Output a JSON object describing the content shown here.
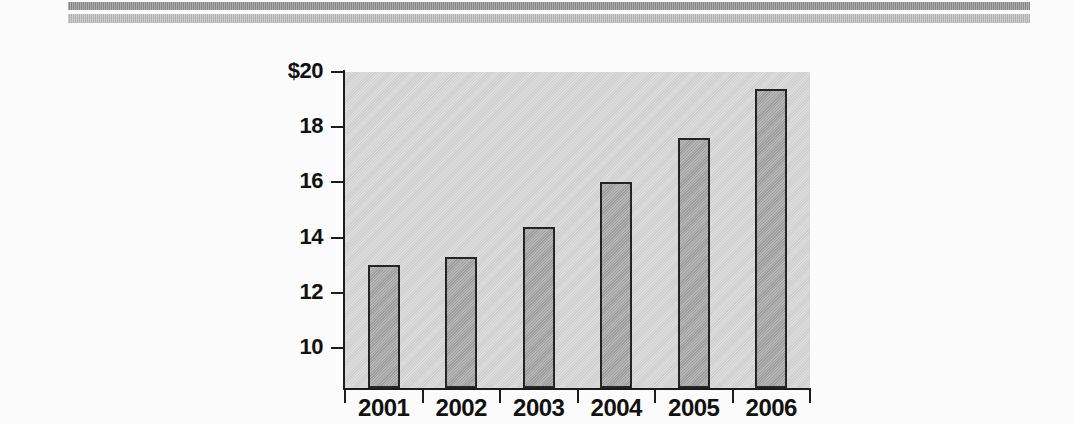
{
  "header": {
    "rule_dark_color": "#8c8c8c",
    "rule_light_color": "#b6b6b6"
  },
  "chart_data": {
    "type": "bar",
    "title": "",
    "subtitle": "",
    "xlabel": "",
    "ylabel": "",
    "categories": [
      "2001",
      "2002",
      "2003",
      "2004",
      "2005",
      "2006"
    ],
    "values": [
      13.0,
      13.3,
      14.4,
      16.0,
      17.6,
      19.4
    ],
    "ytick_labels": [
      "$20",
      "18",
      "16",
      "14",
      "12",
      "10"
    ],
    "ytick_values": [
      20,
      18,
      16,
      14,
      12,
      10
    ],
    "ylim": [
      8.55,
      20
    ],
    "grid": false,
    "legend": false,
    "legend_position": "none",
    "bar_fill_color": "#a6a6a6",
    "bar_edge_color": "#242424",
    "plot_background_color": "#d3d3d3",
    "page_background_color": "#fbfbfb",
    "axis_color": "#1c1c1c"
  }
}
